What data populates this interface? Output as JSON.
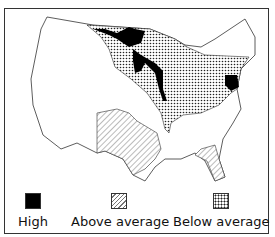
{
  "map": {
    "region": "United States (contiguous)",
    "categories": [
      {
        "key": "high",
        "label": "High",
        "pattern": "solid-black",
        "regions": [
          "Minnesota north",
          "Wisconsin/Mississippi river band",
          "Maryland/Delaware area"
        ]
      },
      {
        "key": "above",
        "label": "Above average",
        "pattern": "diagonal-hatch",
        "regions": [
          "Texas/Oklahoma",
          "Florida"
        ]
      },
      {
        "key": "below",
        "label": "Below average",
        "pattern": "dotted",
        "regions": [
          "Upper Midwest",
          "Ohio Valley",
          "Mid-Atlantic/New York"
        ]
      }
    ],
    "colors": {
      "high": "#000000",
      "outline": "#333333",
      "hatch": "#777777",
      "dots": "#222222"
    }
  },
  "legend": {
    "items": [
      {
        "label": "High"
      },
      {
        "label": "Above average"
      },
      {
        "label": "Below average"
      }
    ]
  }
}
